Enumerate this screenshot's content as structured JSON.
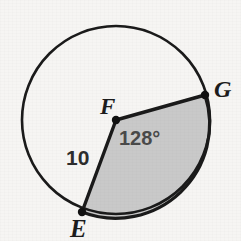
{
  "figure": {
    "type": "circle-sector-diagram",
    "background_color": "#f6f5f3",
    "stroke_color": "#1a1a1a",
    "shade_color": "#c9c9c9",
    "circle": {
      "center_label": "F",
      "center_x": 116,
      "center_y": 120,
      "radius_px": 94,
      "stroke_width": 2.6
    },
    "points": [
      {
        "name": "F",
        "label": "F",
        "role": "center",
        "x": 116,
        "y": 120
      },
      {
        "name": "G",
        "label": "G",
        "role": "on-circle",
        "x": 205,
        "y": 95
      },
      {
        "name": "E",
        "label": "E",
        "role": "on-circle",
        "x": 82,
        "y": 212
      }
    ],
    "sector": {
      "shaded": true,
      "from_point": "G",
      "to_point": "E",
      "central_angle_deg": 128,
      "start_angle_deg": -15.7,
      "end_angle_deg": 110.3
    },
    "labels": {
      "center": "F",
      "point_g": "G",
      "point_e": "E",
      "angle": "128°",
      "radius": "10"
    }
  }
}
